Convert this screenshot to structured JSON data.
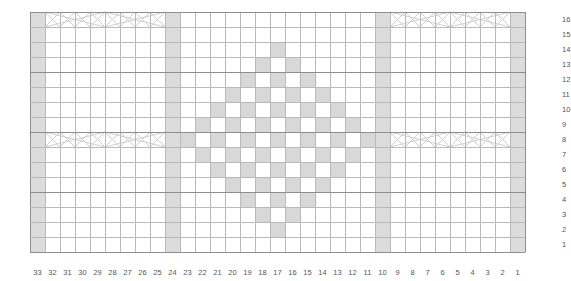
{
  "chart_data": {
    "type": "heatmap",
    "title": "",
    "xlabel": "",
    "ylabel": "",
    "grid": true,
    "legend": "none",
    "columns": 33,
    "rows": 16,
    "column_labels": [
      33,
      32,
      31,
      30,
      29,
      28,
      27,
      26,
      25,
      24,
      23,
      22,
      21,
      20,
      19,
      18,
      17,
      16,
      15,
      14,
      13,
      12,
      11,
      10,
      9,
      8,
      7,
      6,
      5,
      4,
      3,
      2,
      1
    ],
    "row_labels": [
      16,
      15,
      14,
      13,
      12,
      11,
      10,
      9,
      8,
      7,
      6,
      5,
      4,
      3,
      2,
      1
    ],
    "column_order": "right-to-left",
    "row_order": "bottom-to-top",
    "colors": {
      "shaded_cell": "#dcdcdc",
      "empty_cell": "#ffffff",
      "grid_line": "#b9b9b9",
      "major_grid_line": "#8e8e8e",
      "label_text": "#555555",
      "symbol_line": "#cfcfcf",
      "background": "#ffffff"
    },
    "shaded_columns": [
      33,
      24,
      10,
      1
    ],
    "cable_rows": [
      16,
      8
    ],
    "cable_panels": [
      {
        "name": "left-panel",
        "col_start": 32,
        "col_end": 25
      },
      {
        "name": "right-panel",
        "col_start": 9,
        "col_end": 2
      }
    ],
    "shaded_cells": [
      {
        "row": 14,
        "cols": [
          17
        ]
      },
      {
        "row": 13,
        "cols": [
          18,
          16
        ]
      },
      {
        "row": 12,
        "cols": [
          19,
          17,
          15
        ]
      },
      {
        "row": 11,
        "cols": [
          20,
          18,
          16,
          14
        ]
      },
      {
        "row": 10,
        "cols": [
          21,
          19,
          17,
          15,
          13
        ]
      },
      {
        "row": 9,
        "cols": [
          22,
          20,
          18,
          16,
          14,
          12
        ]
      },
      {
        "row": 8,
        "cols": [
          23,
          21,
          19,
          17,
          15,
          13,
          11
        ]
      },
      {
        "row": 7,
        "cols": [
          22,
          20,
          18,
          16,
          14,
          12
        ]
      },
      {
        "row": 6,
        "cols": [
          21,
          19,
          17,
          15,
          13
        ]
      },
      {
        "row": 5,
        "cols": [
          20,
          18,
          16,
          14
        ]
      },
      {
        "row": 4,
        "cols": [
          19,
          17,
          15
        ]
      },
      {
        "row": 3,
        "cols": [
          18,
          16
        ]
      },
      {
        "row": 2,
        "cols": [
          17
        ]
      }
    ]
  }
}
